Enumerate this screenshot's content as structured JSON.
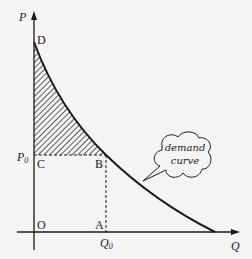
{
  "diagram": {
    "type": "economics-demand-curve",
    "axes": {
      "y_label": "P",
      "x_label": "Q"
    },
    "points": {
      "D": "D",
      "C": "C",
      "B": "B",
      "O": "O",
      "A": "A"
    },
    "price_label": {
      "main": "P",
      "sub": "0"
    },
    "quantity_label": {
      "main": "Q",
      "sub": "0"
    },
    "callout": {
      "line1": "demand",
      "line2": "curve"
    },
    "shaded_region": "consumer surplus (hatched area DCB)",
    "colors": {
      "ink": "#1a1a1a",
      "background": "#f4f4f2"
    }
  }
}
